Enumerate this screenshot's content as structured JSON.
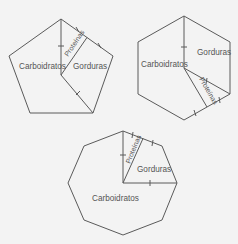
{
  "diagrams": [
    {
      "shape": "pentagon",
      "labels": {
        "carboidratos": "Carboidratos",
        "proteinas": "Proteínas",
        "gorduras": "Gorduras"
      }
    },
    {
      "shape": "hexagon",
      "labels": {
        "carboidratos": "Carboidratos",
        "proteinas": "Proteínas",
        "gorduras": "Gorduras"
      }
    },
    {
      "shape": "octagon",
      "labels": {
        "carboidratos": "Carboidratos",
        "proteinas": "Proteínas",
        "gorduras": "Gorduras"
      }
    }
  ],
  "colors": {
    "background": "#f3f3f3",
    "stroke": "#5a5a5a",
    "text": "#555555"
  }
}
